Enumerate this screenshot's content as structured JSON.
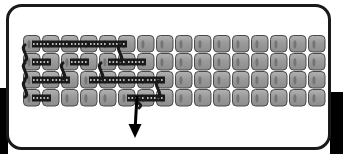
{
  "figure": {
    "kind": "schematic-diagram",
    "title": "",
    "canvas": {
      "width": 343,
      "height": 154,
      "background": "#ffffff"
    },
    "frame": {
      "name": "rounded-enclosure",
      "x": 6,
      "y": 4,
      "width": 325,
      "height": 146,
      "corner_radius": 14,
      "stroke": "#1a1a1a",
      "stroke_width": 3,
      "fill": "#ffffff"
    },
    "black_blocks": [
      {
        "name": "left-black-block",
        "x": 0,
        "y": 88,
        "width": 8,
        "height": 66,
        "fill": "#000000"
      },
      {
        "name": "right-black-block",
        "x": 330,
        "y": 92,
        "width": 13,
        "height": 62,
        "fill": "#000000"
      }
    ],
    "grid": {
      "rows": 4,
      "columns": 16,
      "origin_x": 23,
      "origin_y": 35,
      "cell_width": 18,
      "cell_height": 18,
      "cell_gap_x": 1,
      "cell_gap_y": 0,
      "cell": {
        "fill": "#9a9a9a",
        "fill_light": "#b2b2b2",
        "stroke": "#4a4a4a",
        "stroke_width": 1,
        "corner_radius": 4
      }
    },
    "bonds": {
      "name": "horizontal-dotted-bond",
      "color": "#1a1a1a",
      "dot_color": "#f2f2f2",
      "description": "dark horizontal link with light dotted centerline between adjacent cells",
      "pattern": [
        [
          1,
          1,
          1,
          1,
          1,
          0,
          0,
          0,
          0,
          0,
          0,
          0,
          0,
          0,
          0
        ],
        [
          1,
          0,
          1,
          0,
          1,
          1,
          0,
          0,
          0,
          0,
          0,
          0,
          0,
          0,
          0
        ],
        [
          1,
          1,
          0,
          1,
          1,
          1,
          1,
          0,
          0,
          0,
          0,
          0,
          0,
          0,
          0
        ],
        [
          1,
          0,
          0,
          0,
          0,
          1,
          1,
          0,
          0,
          0,
          0,
          0,
          0,
          0,
          0
        ]
      ]
    },
    "connectors": {
      "name": "s-curve-connector",
      "color": "#1a1a1a",
      "stroke_width": 3,
      "description": "vertical S-shaped links joining cells across rows",
      "items": [
        {
          "column": 0,
          "row_from": 0,
          "row_to": 1
        },
        {
          "column": 0,
          "row_from": 1,
          "row_to": 2
        },
        {
          "column": 0,
          "row_from": 2,
          "row_to": 3
        },
        {
          "column": 2,
          "row_from": 1,
          "row_to": 2
        },
        {
          "column": 4,
          "row_from": 1,
          "row_to": 2
        },
        {
          "column": 5,
          "row_from": 0,
          "row_to": 1
        },
        {
          "column": 7,
          "row_from": 2,
          "row_to": 3
        },
        {
          "column": 6,
          "row_from": 3,
          "row_to": 3
        }
      ]
    },
    "arrow": {
      "name": "downward-arrow",
      "label": "",
      "color": "#000000",
      "start_x": 137,
      "start_y": 96,
      "end_x": 135,
      "end_y": 138,
      "stroke_width": 3,
      "head_width": 13,
      "head_length": 14,
      "direction": "down"
    }
  }
}
